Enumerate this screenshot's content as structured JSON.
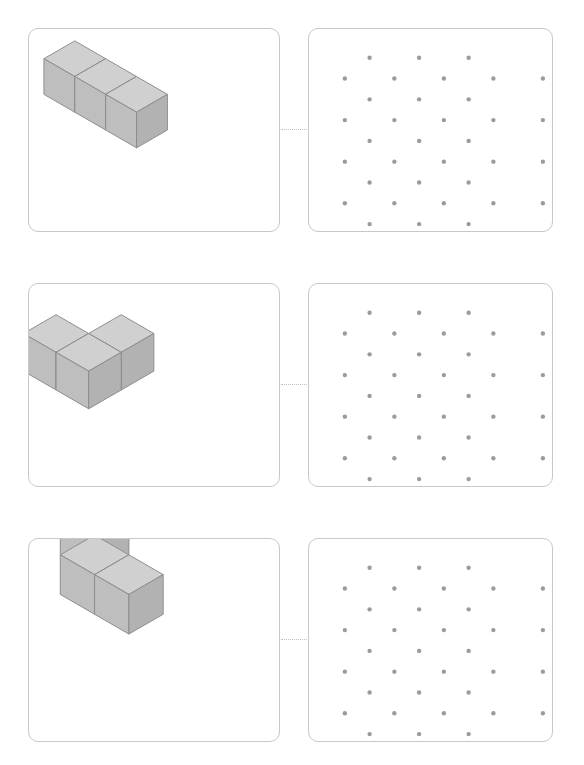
{
  "page": {
    "background_color": "#ffffff",
    "width": 584,
    "height": 765
  },
  "style": {
    "panel_border_color": "#c8c8c8",
    "panel_background": "#ffffff",
    "panel_corner_radius": 10,
    "connector_color": "#c0c0c0",
    "connector_style": "dotted",
    "dot_color": "#9b9b9e",
    "dot_radius": 2.2,
    "cube_top_face_color": "#d0d0d0",
    "cube_left_face_color": "#bebebe",
    "cube_right_face_color": "#b2b2b2",
    "cube_edge_color": "#8d8d8d"
  },
  "grid": {
    "description": "Isometric dot grid, staggered rows",
    "rows": 9,
    "dots_in_major_row": 5,
    "dots_in_minor_row": 3,
    "major_row_x": [
      18,
      68,
      118,
      168,
      218
    ],
    "minor_row_x": [
      43,
      93,
      143
    ],
    "row_y": [
      29,
      50,
      71,
      92,
      113,
      134,
      155,
      176,
      197
    ],
    "total_dots": 36
  },
  "problems": [
    {
      "index": 1,
      "row_top": 28,
      "shape_name": "three-cube-row",
      "shape_label": "1 x 3 straight row of cubes",
      "cube_count": 3,
      "cubes": [
        {
          "x": 0,
          "y": 0,
          "z": 0
        },
        {
          "x": 1,
          "y": 0,
          "z": 0
        },
        {
          "x": 2,
          "y": 0,
          "z": 0
        }
      ],
      "origin": {
        "x": 46,
        "y": 48
      },
      "cube_size": 36
    },
    {
      "index": 2,
      "row_top": 283,
      "shape_name": "flat-l-tromino",
      "shape_label": "L-shaped tromino lying flat",
      "cube_count": 3,
      "cubes": [
        {
          "x": 0,
          "y": 1,
          "z": 0
        },
        {
          "x": 1,
          "y": 1,
          "z": 0
        },
        {
          "x": 1,
          "y": 0,
          "z": 0
        }
      ],
      "origin": {
        "x": 60,
        "y": 50
      },
      "cube_size": 38
    },
    {
      "index": 3,
      "row_top": 538,
      "shape_name": "upright-l-tromino",
      "shape_label": "L-shaped tromino standing upright",
      "cube_count": 3,
      "cubes": [
        {
          "x": 0,
          "y": 0,
          "z": 0
        },
        {
          "x": 0,
          "y": 0,
          "z": 1
        },
        {
          "x": 1,
          "y": 0,
          "z": 0
        }
      ],
      "origin": {
        "x": 66,
        "y": 36
      },
      "cube_size": 40
    }
  ]
}
